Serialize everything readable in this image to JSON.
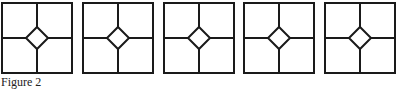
{
  "figure": {
    "caption": "Figure 2",
    "panels": [
      {
        "x": 2,
        "y": 3,
        "size": 70
      },
      {
        "x": 83,
        "y": 3,
        "size": 70
      },
      {
        "x": 164,
        "y": 3,
        "size": 70
      },
      {
        "x": 244,
        "y": 3,
        "size": 70
      },
      {
        "x": 325,
        "y": 3,
        "size": 70
      }
    ],
    "diamond_half": 11,
    "stroke_color": "#1a1a1a",
    "stroke_width": 2
  }
}
